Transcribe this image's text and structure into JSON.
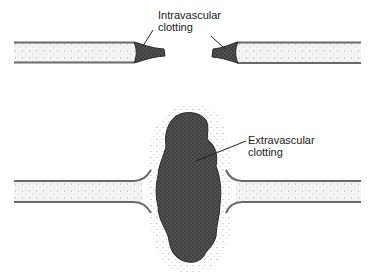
{
  "diagram": {
    "type": "illustration",
    "colors": {
      "background": "#ffffff",
      "vessel_wall": "#6a6a6a",
      "vessel_fill": "#f2f2f2",
      "clot": "#4a4a4a",
      "stipple": "#8a8a8a"
    },
    "labels": {
      "intravascular": {
        "line1": "Intravascular",
        "line2": "clotting"
      },
      "extravascular": {
        "line1": "Extravascular",
        "line2": "clotting"
      }
    },
    "panels": [
      {
        "name": "top",
        "description": "cut vessel ends sealed by intravascular clots (tapered plugs)"
      },
      {
        "name": "bottom",
        "description": "cut vessel ends bleeding into large extravascular clot mass"
      }
    ]
  }
}
